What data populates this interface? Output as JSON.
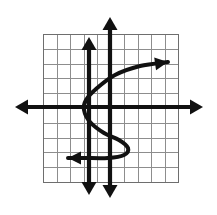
{
  "figure": {
    "width": 217,
    "height": 215,
    "background_color": "#ffffff"
  },
  "colors": {
    "grid_line": "#8d8d8d",
    "grid_border": "#6e6e6e",
    "axis": "#111111",
    "curve": "#111111"
  },
  "chart_data": {
    "type": "line",
    "title": "",
    "subtitle": "",
    "xlabel": "",
    "ylabel": "",
    "grid": true,
    "legend": "none",
    "tick_labels": {
      "x": [],
      "y": []
    },
    "grid_spec": {
      "columns": 10,
      "rows": 10,
      "cell_size_px": 13.5,
      "left_px": 43,
      "top_px": 34,
      "right_px": 178,
      "bottom_px": 182
    },
    "axes": [
      {
        "name": "x-axis",
        "orientation": "horizontal",
        "y_px": 107,
        "x_start_px": 15,
        "x_end_px": 203,
        "arrow_start": true,
        "arrow_end": true
      },
      {
        "name": "vertical-line-left",
        "orientation": "vertical",
        "x_px": 89,
        "y_start_px": 37,
        "y_end_px": 195,
        "arrow_start": true,
        "arrow_end": true
      },
      {
        "name": "vertical-line-right",
        "orientation": "vertical",
        "x_px": 110,
        "y_start_px": 17,
        "y_end_px": 198,
        "arrow_start": true,
        "arrow_end": true
      }
    ],
    "series": [
      {
        "name": "sideways-s-curve",
        "description": "Sideways S shaped curve failing the vertical line test, arrowheads at upper-right and lower-left",
        "arrow_start": true,
        "arrow_end": true,
        "points_px": [
          [
            168,
            62
          ],
          [
            140,
            66
          ],
          [
            115,
            75
          ],
          [
            96,
            89
          ],
          [
            86,
            100
          ],
          [
            84,
            110
          ],
          [
            90,
            122
          ],
          [
            104,
            133
          ],
          [
            119,
            140
          ],
          [
            128,
            148
          ],
          [
            124,
            155
          ],
          [
            108,
            158
          ],
          [
            84,
            158
          ],
          [
            68,
            158
          ]
        ]
      }
    ]
  }
}
